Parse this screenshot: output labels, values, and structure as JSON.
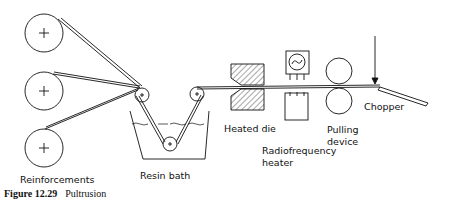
{
  "figure": {
    "number": "Figure 12.29",
    "title": "Pultrusion"
  },
  "labels": {
    "reinforcements": "Reinforcements",
    "resin_bath": "Resin bath",
    "heated_die": "Heated die",
    "rf_heater_line1": "Radiofrequency",
    "rf_heater_line2": "heater",
    "pulling_line1": "Pulling",
    "pulling_line2": "device",
    "chopper": "Chopper"
  },
  "components": [
    {
      "name": "reinforcement-spools",
      "count": 3
    },
    {
      "name": "guide-rollers",
      "count": 3
    },
    {
      "name": "resin-bath"
    },
    {
      "name": "heated-die"
    },
    {
      "name": "radiofrequency-heater"
    },
    {
      "name": "pulling-device",
      "rollers": 2
    },
    {
      "name": "chopper"
    }
  ]
}
